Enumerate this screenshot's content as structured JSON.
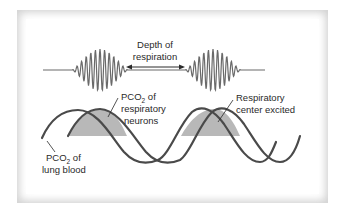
{
  "figure": {
    "title_line1": "Depth of",
    "title_line2": "respiration",
    "labels": {
      "neurons_line1_prefix": "PCO",
      "neurons_line1_sub": "2",
      "neurons_line1_suffix": " of",
      "neurons_line2": "respiratory",
      "neurons_line3": "neurons",
      "excited_line1": "Respiratory",
      "excited_line2": "center excited",
      "lung_line1_prefix": "PCO",
      "lung_line1_sub": "2",
      "lung_line1_suffix": " of",
      "lung_line2": "lung blood"
    },
    "colors": {
      "curve": "#4a4a4a",
      "waveform": "#6a6a6a",
      "shade": "#b8b8b8",
      "frame": "#e0e0e0",
      "text": "#2a2a2a"
    },
    "waveform": {
      "baseline_y": 70,
      "bursts": [
        {
          "center_x": 100,
          "half_width": 28
        },
        {
          "center_x": 213,
          "half_width": 28
        }
      ]
    },
    "curves": [
      {
        "name": "PCO2 of lung blood",
        "phase_offset_px": 0
      },
      {
        "name": "PCO2 of respiratory neurons",
        "phase_offset_px": 22
      }
    ]
  }
}
